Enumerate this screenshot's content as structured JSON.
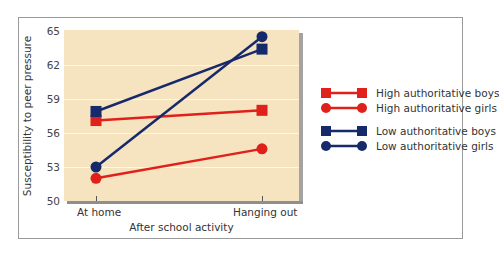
{
  "chart_data": {
    "type": "line",
    "title": "",
    "xlabel": "After school activity",
    "ylabel": "Susceptibility to peer pressure",
    "categories": [
      "At home",
      "Hanging out"
    ],
    "ylim": [
      50,
      65
    ],
    "yticks": [
      50,
      53,
      56,
      59,
      62,
      65
    ],
    "grid": true,
    "legend_position": "right",
    "series": [
      {
        "name": "High authoritative boys",
        "color": "#e0201a",
        "marker": "square",
        "values": [
          57.1,
          58.0
        ]
      },
      {
        "name": "High authoritative girls",
        "color": "#e0201a",
        "marker": "circle",
        "values": [
          52.0,
          54.6
        ]
      },
      {
        "name": "Low authoritative boys",
        "color": "#16296b",
        "marker": "square",
        "values": [
          57.9,
          63.4
        ]
      },
      {
        "name": "Low authoritative girls",
        "color": "#16296b",
        "marker": "circle",
        "values": [
          53.0,
          64.5
        ]
      }
    ]
  },
  "axis": {
    "xlabel": "After school activity",
    "ylabel": "Susceptibility to peer pressure",
    "yticks": [
      "65",
      "62",
      "59",
      "56",
      "53",
      "50"
    ],
    "xticks": [
      "At home",
      "Hanging out"
    ]
  },
  "legend": [
    {
      "label": "High authoritative boys"
    },
    {
      "label": "High authoritative girls"
    },
    {
      "label": "Low authoritative boys"
    },
    {
      "label": "Low authoritative girls"
    }
  ],
  "colors": {
    "high": "#e0201a",
    "low": "#16296b",
    "plot_bg": "#f6e3bf"
  }
}
